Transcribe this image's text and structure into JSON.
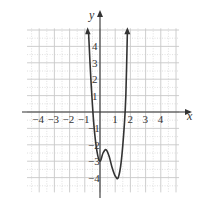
{
  "chart_data": {
    "type": "line",
    "title": "",
    "xlabel": "x",
    "ylabel": "y",
    "xlim": [
      -5,
      5
    ],
    "ylim": [
      -5,
      5
    ],
    "grid": true,
    "x_ticks": [
      -4,
      -3,
      -2,
      -1,
      1,
      2,
      3,
      4
    ],
    "y_ticks": [
      4,
      3,
      2,
      1,
      -1,
      -2,
      -3,
      -4
    ],
    "x_tick_labels": [
      "-4",
      "-3",
      "-2",
      "-1",
      "1",
      "2",
      "3",
      "4"
    ],
    "y_tick_labels": [
      "4",
      "3",
      "2",
      "1",
      "-1",
      "-2",
      "-3",
      "-4"
    ],
    "series": [
      {
        "name": "f(x)",
        "x": [
          -0.75,
          -0.6,
          -0.4,
          -0.2,
          0.0,
          0.2,
          0.4,
          0.6,
          0.8,
          1.0,
          1.2,
          1.4,
          1.6,
          1.7,
          1.8
        ],
        "y": [
          4.8,
          2.0,
          -0.8,
          -2.4,
          -3.0,
          -2.5,
          -2.3,
          -2.7,
          -3.4,
          -3.9,
          -4.0,
          -3.0,
          -0.8,
          1.0,
          4.8
        ],
        "arrows_at_ends": true
      }
    ],
    "annotations": []
  },
  "axes": {
    "x_label": "x",
    "y_label": "y"
  },
  "colors": {
    "curve": "#333333",
    "axis": "#333333",
    "grid_major": "#c8c8c8",
    "grid_minor": "#d8d8d8"
  }
}
